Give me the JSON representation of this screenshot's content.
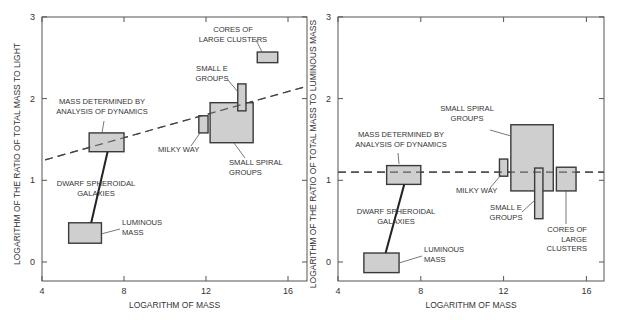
{
  "colors": {
    "box_fill": "#cfcfcf",
    "box_stroke": "#3a3a3a",
    "axis": "#555555",
    "text": "#333333",
    "background": "#ffffff"
  },
  "chart_data": [
    {
      "type": "scatter",
      "title": "",
      "xlabel": "LOGARITHM OF MASS",
      "ylabel": "LOGARITHM OF THE RATIO OF TOTAL MASS TO LIGHT",
      "xlim": [
        4,
        17
      ],
      "ylim": [
        -0.23,
        3
      ],
      "xticks": [
        4,
        8,
        12,
        16
      ],
      "yticks": [
        0,
        1,
        2,
        3
      ],
      "grid": false,
      "legend": "none",
      "pixel_frame": {
        "left": 42,
        "right": 307,
        "top": 17,
        "bottom": 281,
        "x0": 42,
        "x_per_unit": 20.5,
        "y0": 262,
        "y_per_unit": 81.7
      },
      "trend_line": {
        "style": "dashed",
        "x": [
          4.15,
          16.9
        ],
        "y": [
          1.25,
          2.15
        ]
      },
      "boxes": [
        {
          "name": "Mass determined by analysis of dynamics (dwarf spheroidal)",
          "x": [
            6.3,
            8.0
          ],
          "y": [
            1.35,
            1.58
          ]
        },
        {
          "name": "Luminous mass (dwarf spheroidal)",
          "x": [
            5.3,
            6.9
          ],
          "y": [
            0.23,
            0.48
          ]
        },
        {
          "name": "Milky Way",
          "x": [
            11.65,
            12.1
          ],
          "y": [
            1.58,
            1.79
          ]
        },
        {
          "name": "Small spiral groups",
          "x": [
            12.2,
            14.3
          ],
          "y": [
            1.46,
            1.95
          ]
        },
        {
          "name": "Small E groups",
          "x": [
            13.55,
            13.95
          ],
          "y": [
            1.85,
            2.18
          ]
        },
        {
          "name": "Cores of large clusters",
          "x": [
            14.5,
            15.5
          ],
          "y": [
            2.44,
            2.57
          ]
        }
      ],
      "connector": {
        "from": [
          6.4,
          0.48
        ],
        "to": [
          7.2,
          1.35
        ]
      },
      "annotations": [
        {
          "lines": [
            "CORES OF",
            "LARGE CLUSTERS"
          ],
          "x": 233,
          "y": 32,
          "anchor": "middle",
          "leader": [
            [
              256,
              40
            ],
            [
              262,
              52
            ]
          ]
        },
        {
          "lines": [
            "SMALL E",
            "GROUPS"
          ],
          "x": 212,
          "y": 71,
          "anchor": "middle",
          "leader": [
            [
              228,
              80
            ],
            [
              238,
              92
            ]
          ]
        },
        {
          "lines": [
            "MASS DETERMINED BY",
            "ANALYSIS OF DYNAMICS"
          ],
          "x": 102,
          "y": 104,
          "anchor": "middle",
          "leader": [
            [
              104,
              121
            ],
            [
              102,
              133
            ]
          ]
        },
        {
          "lines": [
            "MILKY WAY"
          ],
          "x": 158,
          "y": 152,
          "anchor": "start",
          "leader": [
            [
              191,
              146
            ],
            [
              200,
              133
            ]
          ]
        },
        {
          "lines": [
            "SMALL SPIRAL",
            "GROUPS"
          ],
          "x": 229,
          "y": 165,
          "anchor": "start",
          "leader": [
            [
              245,
              158
            ],
            [
              234,
              143
            ]
          ]
        },
        {
          "lines": [
            "DWARF SPHEROIDAL",
            "GALAXIES"
          ],
          "x": 96,
          "y": 186,
          "anchor": "middle",
          "leader": null
        },
        {
          "lines": [
            "LUMINOUS",
            "MASS"
          ],
          "x": 122,
          "y": 225,
          "anchor": "start",
          "leader": [
            [
              120,
              229
            ],
            [
              101,
              234
            ]
          ]
        }
      ]
    },
    {
      "type": "scatter",
      "title": "",
      "xlabel": "LOGARITHM OF MASS",
      "ylabel": "LOGARITHM OF THE RATIO OF TOTAL MASS TO LUMINOUS MASS",
      "xlim": [
        4,
        17
      ],
      "ylim": [
        -0.23,
        3
      ],
      "xticks": [
        4,
        8,
        12,
        16
      ],
      "yticks": [
        0,
        1,
        2,
        3
      ],
      "grid": false,
      "legend": "none",
      "pixel_frame": {
        "left": 338,
        "right": 604,
        "top": 17,
        "bottom": 281,
        "x0": 338,
        "x_per_unit": 20.7,
        "y0": 262,
        "y_per_unit": 81.7
      },
      "trend_line": {
        "style": "dashed",
        "x": [
          4.0,
          17.0
        ],
        "y": [
          1.1,
          1.1
        ]
      },
      "boxes": [
        {
          "name": "Mass determined by analysis of dynamics (dwarf spheroidal)",
          "x": [
            6.35,
            8.0
          ],
          "y": [
            0.95,
            1.18
          ]
        },
        {
          "name": "Luminous mass (dwarf spheroidal)",
          "x": [
            5.25,
            6.95
          ],
          "y": [
            -0.13,
            0.11
          ]
        },
        {
          "name": "Milky Way",
          "x": [
            11.8,
            12.2
          ],
          "y": [
            1.05,
            1.26
          ]
        },
        {
          "name": "Small spiral groups",
          "x": [
            12.35,
            14.4
          ],
          "y": [
            0.87,
            1.68
          ]
        },
        {
          "name": "Small E groups",
          "x": [
            13.5,
            13.9
          ],
          "y": [
            0.53,
            1.15
          ]
        },
        {
          "name": "Cores of large clusters",
          "x": [
            14.55,
            15.5
          ],
          "y": [
            0.87,
            1.16
          ]
        }
      ],
      "connector": {
        "from": [
          6.3,
          0.11
        ],
        "to": [
          7.2,
          0.95
        ]
      },
      "annotations": [
        {
          "lines": [
            "SMALL SPIRAL",
            "GROUPS"
          ],
          "x": 467,
          "y": 111,
          "anchor": "middle",
          "leader": [
            [
              490,
              130
            ],
            [
              511,
              136
            ]
          ]
        },
        {
          "lines": [
            "MASS DETERMINED BY",
            "ANALYSIS OF DYNAMICS"
          ],
          "x": 401,
          "y": 137,
          "anchor": "middle",
          "leader": [
            [
              398,
              153
            ],
            [
              399,
              164
            ]
          ]
        },
        {
          "lines": [
            "MILKY WAY"
          ],
          "x": 456,
          "y": 193,
          "anchor": "start",
          "leader": [
            [
              490,
              188
            ],
            [
              501,
              175
            ]
          ]
        },
        {
          "lines": [
            "DWARF SPHEROIDAL",
            "GALAXIES"
          ],
          "x": 396,
          "y": 214,
          "anchor": "middle",
          "leader": null
        },
        {
          "lines": [
            "SMALL E",
            "GROUPS"
          ],
          "x": 506,
          "y": 210,
          "anchor": "middle",
          "leader": [
            [
              522,
              212
            ],
            [
              535,
              200
            ]
          ]
        },
        {
          "lines": [
            "CORES OF",
            "LARGE",
            "CLUSTERS"
          ],
          "x": 587,
          "y": 232,
          "anchor": "end",
          "leader": [
            [
              566,
              224
            ],
            [
              566,
              190
            ]
          ]
        },
        {
          "lines": [
            "LUMINOUS",
            "MASS"
          ],
          "x": 424,
          "y": 252,
          "anchor": "start",
          "leader": [
            [
              422,
              256
            ],
            [
              399,
              263
            ]
          ]
        }
      ]
    }
  ]
}
